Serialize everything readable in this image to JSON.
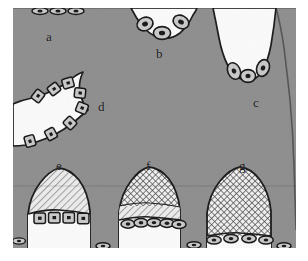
{
  "figure": {
    "type": "histology-schematic",
    "background_color": "#ffffff",
    "tissue_fill_color": "#8d8d8d",
    "lumen_fill_color": "#fbfbfb",
    "outline_color": "#171717",
    "cell_fill_color": "#c9c9c9",
    "nucleus_color": "#161616",
    "canvas": {
      "width": 308,
      "height": 261
    }
  },
  "labels": [
    {
      "id": "a",
      "text": "a",
      "x": 46,
      "y": 30,
      "description": "squamous flattened cells on straight upper border"
    },
    {
      "id": "b",
      "text": "b",
      "x": 156,
      "y": 47,
      "description": "rounded cells lining shallow upper concavity"
    },
    {
      "id": "c",
      "text": "c",
      "x": 253,
      "y": 96,
      "description": "oval cells at base of deep right notch"
    },
    {
      "id": "d",
      "text": "d",
      "x": 98,
      "y": 100,
      "description": "cuboidal cells along left convex boundary"
    },
    {
      "id": "e",
      "text": "e",
      "x": 56,
      "y": 159,
      "description": "diagonally hatched mound with cuboidal cells"
    },
    {
      "id": "f",
      "text": "f",
      "x": 146,
      "y": 159,
      "description": "two-zone mound, cross-hatch over diagonal hatch, flattened cells"
    },
    {
      "id": "g",
      "text": "g",
      "x": 239,
      "y": 159,
      "description": "fully cross-hatched mound with flattened cells"
    }
  ],
  "regions": [
    {
      "id": "a",
      "cell_shape": "squamous",
      "cell_count": 3,
      "hatch": "none"
    },
    {
      "id": "b",
      "cell_shape": "round",
      "cell_count": 3,
      "hatch": "none"
    },
    {
      "id": "c",
      "cell_shape": "oval",
      "cell_count": 3,
      "hatch": "none"
    },
    {
      "id": "d",
      "cell_shape": "cuboidal",
      "cell_count": 6,
      "hatch": "none"
    },
    {
      "id": "e",
      "cell_shape": "cuboidal",
      "cell_count": 4,
      "hatch": "diagonal"
    },
    {
      "id": "f",
      "cell_shape": "squamous",
      "cell_count": 5,
      "hatch": "cross-hatch-over-diagonal"
    },
    {
      "id": "g",
      "cell_shape": "squamous",
      "cell_count": 4,
      "hatch": "cross-hatch"
    }
  ]
}
